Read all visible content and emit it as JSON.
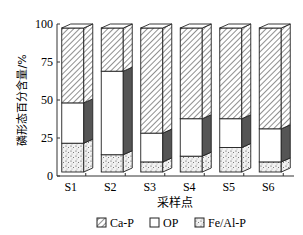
{
  "chart_data": {
    "type": "bar",
    "stacked": true,
    "title": "",
    "xlabel": "采样点",
    "ylabel": "磷形态百分含量/%",
    "ylim": [
      0,
      100
    ],
    "yticks": [
      0,
      25,
      50,
      75,
      100
    ],
    "categories": [
      "S1",
      "S2",
      "S3",
      "S4",
      "S5",
      "S6"
    ],
    "series": [
      {
        "name": "Fe/Al-P",
        "pattern": "dots",
        "values": [
          20,
          12,
          7,
          11,
          17,
          7
        ]
      },
      {
        "name": "OP",
        "pattern": "white",
        "values": [
          28,
          58,
          20,
          26,
          20,
          23
        ]
      },
      {
        "name": "Ca-P",
        "pattern": "hatch",
        "values": [
          52,
          30,
          73,
          63,
          63,
          70
        ]
      }
    ],
    "legend": {
      "position": "bottom",
      "entries": [
        "Ca-P",
        "OP",
        "Fe/Al-P"
      ]
    },
    "grid": false,
    "style": "3d-bars"
  }
}
